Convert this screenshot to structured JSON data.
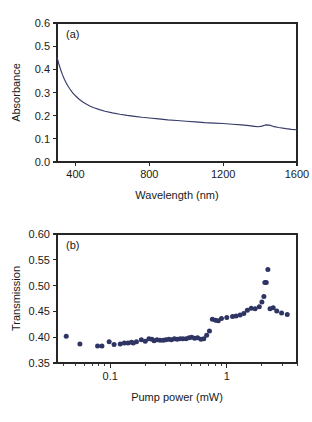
{
  "figure": {
    "background": "#ffffff",
    "marker_color": "#2e3463",
    "curve_color": "#363c68",
    "axis_color": "#262626"
  },
  "chart_data": [
    {
      "type": "line",
      "panel_tag": "(a)",
      "title": "",
      "xlabel": "Wavelength (nm)",
      "ylabel": "Absorbance",
      "xlim": [
        300,
        1600
      ],
      "ylim": [
        0.0,
        0.6
      ],
      "xticks": [
        400,
        800,
        1200,
        1600
      ],
      "xticklabels": [
        "400",
        "800",
        "1200",
        "1600"
      ],
      "yticks": [
        0.0,
        0.1,
        0.2,
        0.3,
        0.4,
        0.5,
        0.6
      ],
      "yticklabels": [
        "0.0",
        "0.1",
        "0.2",
        "0.3",
        "0.4",
        "0.5",
        "0.6"
      ],
      "xscale": "linear",
      "yscale": "linear",
      "grid": false,
      "legend": "none",
      "series": [
        {
          "name": "absorbance spectrum",
          "x": [
            300,
            310,
            320,
            330,
            340,
            350,
            360,
            370,
            380,
            390,
            400,
            420,
            440,
            460,
            480,
            500,
            530,
            560,
            600,
            640,
            680,
            720,
            760,
            800,
            850,
            900,
            950,
            1000,
            1050,
            1100,
            1150,
            1200,
            1250,
            1300,
            1340,
            1370,
            1390,
            1410,
            1430,
            1450,
            1470,
            1500,
            1540,
            1570,
            1600
          ],
          "y": [
            0.452,
            0.423,
            0.398,
            0.376,
            0.357,
            0.341,
            0.327,
            0.315,
            0.304,
            0.294,
            0.286,
            0.271,
            0.259,
            0.249,
            0.241,
            0.234,
            0.226,
            0.219,
            0.212,
            0.206,
            0.201,
            0.197,
            0.193,
            0.19,
            0.186,
            0.182,
            0.179,
            0.176,
            0.173,
            0.17,
            0.168,
            0.166,
            0.163,
            0.16,
            0.157,
            0.154,
            0.152,
            0.155,
            0.16,
            0.159,
            0.154,
            0.149,
            0.144,
            0.141,
            0.139
          ]
        }
      ]
    },
    {
      "type": "scatter",
      "panel_tag": "(b)",
      "title": "",
      "xlabel": "Pump power (mW)",
      "ylabel": "Transmission",
      "xlim": [
        0.035,
        4.0
      ],
      "ylim": [
        0.35,
        0.6
      ],
      "xticks": [
        0.1,
        1
      ],
      "xticklabels": [
        "0.1",
        "1"
      ],
      "yticks": [
        0.35,
        0.4,
        0.45,
        0.5,
        0.55,
        0.6
      ],
      "yticklabels": [
        "0.35",
        "0.40",
        "0.45",
        "0.50",
        "0.55",
        "0.60"
      ],
      "xscale": "log",
      "yscale": "linear",
      "grid": false,
      "legend": "none",
      "series": [
        {
          "name": "transmission vs pump power",
          "x": [
            0.042,
            0.055,
            0.078,
            0.085,
            0.098,
            0.108,
            0.122,
            0.132,
            0.142,
            0.152,
            0.158,
            0.168,
            0.185,
            0.2,
            0.215,
            0.228,
            0.238,
            0.252,
            0.268,
            0.285,
            0.3,
            0.318,
            0.335,
            0.355,
            0.375,
            0.398,
            0.42,
            0.448,
            0.475,
            0.5,
            0.53,
            0.562,
            0.6,
            0.635,
            0.672,
            0.71,
            0.752,
            0.8,
            0.845,
            0.9,
            1.0,
            1.12,
            1.2,
            1.3,
            1.4,
            1.5,
            1.62,
            1.75,
            1.9,
            2.0,
            2.08,
            2.12,
            2.18,
            2.25,
            2.35,
            2.5,
            2.68,
            2.95,
            3.3
          ],
          "y": [
            0.402,
            0.387,
            0.383,
            0.383,
            0.391,
            0.386,
            0.387,
            0.389,
            0.389,
            0.39,
            0.389,
            0.391,
            0.395,
            0.392,
            0.397,
            0.396,
            0.393,
            0.395,
            0.394,
            0.394,
            0.395,
            0.396,
            0.395,
            0.397,
            0.396,
            0.397,
            0.397,
            0.397,
            0.399,
            0.4,
            0.398,
            0.399,
            0.396,
            0.397,
            0.404,
            0.412,
            0.435,
            0.433,
            0.432,
            0.436,
            0.438,
            0.44,
            0.441,
            0.443,
            0.446,
            0.452,
            0.456,
            0.455,
            0.459,
            0.468,
            0.479,
            0.506,
            0.506,
            0.531,
            0.455,
            0.457,
            0.451,
            0.447,
            0.444
          ]
        }
      ]
    }
  ]
}
